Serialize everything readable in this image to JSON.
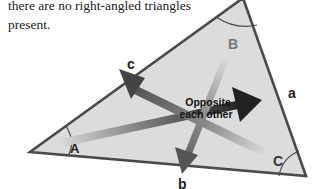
{
  "caption": {
    "line1": "there are no right-angled triangles",
    "line2": "present."
  },
  "diagram": {
    "vertices": {
      "A": "A",
      "B": "B",
      "C": "C"
    },
    "sides": {
      "a": "a",
      "b": "b",
      "c": "c"
    },
    "center_label": {
      "line1": "Opposite",
      "line2": "each other"
    },
    "colors": {
      "fill": "#dcdcdc",
      "stroke": "#4a4a4a",
      "arrow_dark": "#2a2a2a",
      "arrow_mid": "#555555",
      "vertex_label": "#666666",
      "background": "#ffffff"
    }
  }
}
